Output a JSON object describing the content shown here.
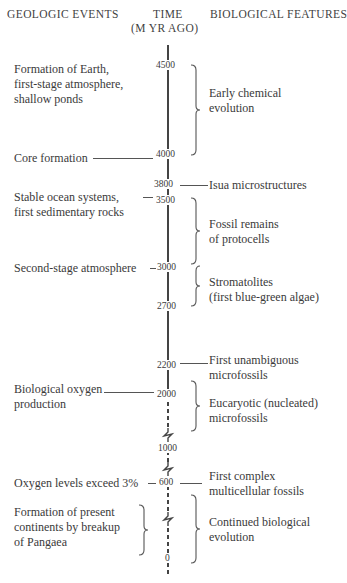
{
  "headers": {
    "geologic": "GEOLOGIC EVENTS",
    "time_line1": "TIME",
    "time_line2": "(M YR AGO)",
    "biological": "BIOLOGICAL FEATURES"
  },
  "time_ticks": [
    "4500",
    "4000",
    "3800",
    "3500",
    "3000",
    "2700",
    "2200",
    "2000",
    "1000",
    "600",
    "0"
  ],
  "geologic_events": [
    {
      "lines": [
        "Formation of Earth,",
        "first-stage atmosphere,",
        "shallow ponds"
      ],
      "time": "4500"
    },
    {
      "lines": [
        "Core formation"
      ],
      "time": "4000"
    },
    {
      "lines": [
        "Stable ocean systems,",
        "first sedimentary rocks"
      ],
      "time": "3500"
    },
    {
      "lines": [
        "Second-stage atmosphere"
      ],
      "time": "3000"
    },
    {
      "lines": [
        "Biological oxygen",
        "production"
      ],
      "time": "2000"
    },
    {
      "lines": [
        "Oxygen levels exceed 3%"
      ],
      "time": "600"
    },
    {
      "lines": [
        "Formation of present",
        "continents by breakup",
        "of Pangaea"
      ],
      "time": "600-0"
    }
  ],
  "biological_features": [
    {
      "lines": [
        "Early chemical",
        "evolution"
      ],
      "time": "4500-4000"
    },
    {
      "lines": [
        "Isua microstructures"
      ],
      "time": "3800"
    },
    {
      "lines": [
        "Fossil remains",
        "of protocells"
      ],
      "time": "3500-3000"
    },
    {
      "lines": [
        "Stromatolites",
        "(first blue-green algae)"
      ],
      "time": "3000-2700"
    },
    {
      "lines": [
        "First unambiguous",
        "microfossils"
      ],
      "time": "2200"
    },
    {
      "lines": [
        "Eucaryotic (nucleated)",
        "microfossils"
      ],
      "time": "2000-1500"
    },
    {
      "lines": [
        "First complex",
        "multicellular fossils"
      ],
      "time": "600"
    },
    {
      "lines": [
        "Continued biological",
        "evolution"
      ],
      "time": "600-0"
    }
  ]
}
